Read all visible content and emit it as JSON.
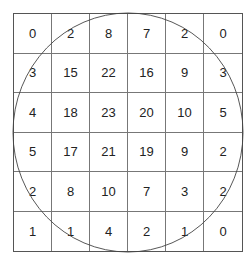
{
  "figure": {
    "rows": [
      [
        "0",
        "2",
        "8",
        "7",
        "2",
        "0"
      ],
      [
        "3",
        "15",
        "22",
        "16",
        "9",
        "3"
      ],
      [
        "4",
        "18",
        "23",
        "20",
        "10",
        "5"
      ],
      [
        "5",
        "17",
        "21",
        "19",
        "9",
        "2"
      ],
      [
        "2",
        "8",
        "10",
        "7",
        "3",
        "2"
      ],
      [
        "1",
        "1",
        "4",
        "2",
        "1",
        "0"
      ]
    ]
  }
}
